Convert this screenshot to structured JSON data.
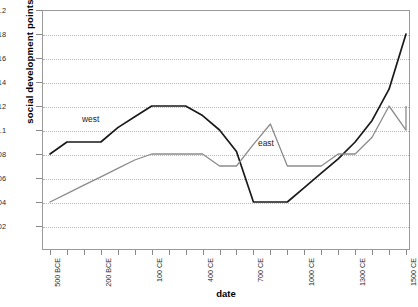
{
  "chart_data": {
    "type": "line",
    "title": "",
    "xlabel": "date",
    "ylabel": "social development points",
    "ylim": [
      0,
      0.2
    ],
    "ytick_values": [
      0.02,
      0.04,
      0.06,
      0.08,
      0.1,
      0.12,
      0.14,
      0.16,
      0.18,
      0.2
    ],
    "ytick_labels": [
      "0.02",
      "0.04",
      "0.06",
      "0.08",
      "0.1",
      "0.12",
      "0.14",
      "0.16",
      "0.18",
      "0.2"
    ],
    "grid": true,
    "legend_position": "inline-annotations",
    "x_tick_count": 22,
    "x_labeled_indices": [
      0,
      3,
      6,
      9,
      12,
      15,
      18,
      21
    ],
    "xtick_labels": [
      "500 BCE",
      "200 BCE",
      "100 CE",
      "400 CE",
      "700 CE",
      "1000 CE",
      "1300 CE",
      "1500 CE"
    ],
    "x": [
      "500 BCE",
      "400 BCE",
      "300 BCE",
      "200 BCE",
      "100 BCE",
      "1 CE",
      "100 CE",
      "200 CE",
      "300 CE",
      "400 CE",
      "500 CE",
      "600 CE",
      "700 CE",
      "800 CE",
      "900 CE",
      "1000 CE",
      "1100 CE",
      "1200 CE",
      "1300 CE",
      "1400 CE",
      "1450 CE",
      "1500 CE"
    ],
    "series": [
      {
        "name": "west",
        "color": "#1a1a1a",
        "values": [
          0.08,
          0.09,
          0.09,
          0.09,
          0.102,
          0.111,
          0.12,
          0.12,
          0.12,
          0.112,
          0.1,
          0.082,
          0.04,
          0.04,
          0.04,
          0.052,
          0.064,
          0.076,
          0.09,
          0.108,
          0.134,
          0.18
        ]
      },
      {
        "name": "east",
        "color": "#8c8c8c",
        "values": [
          0.04,
          0.047,
          0.054,
          0.061,
          0.068,
          0.075,
          0.08,
          0.08,
          0.08,
          0.08,
          0.07,
          0.07,
          0.088,
          0.105,
          0.07,
          0.07,
          0.07,
          0.08,
          0.08,
          0.094,
          0.12,
          0.1
        ]
      }
    ],
    "series_extra": {
      "east_tail_x": 21,
      "east_tail_value": 0.12
    },
    "annotations": [
      {
        "name": "west",
        "label": "west"
      },
      {
        "name": "east",
        "label": "east"
      }
    ]
  }
}
